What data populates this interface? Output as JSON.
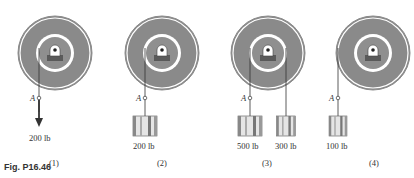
{
  "figure": {
    "caption": "Fig. P16.46",
    "point_label": "A",
    "panels": [
      {
        "id": "(1)",
        "load": "200 lb",
        "load_type": "force-arrow"
      },
      {
        "id": "(2)",
        "load": "200 lb",
        "load_type": "block"
      },
      {
        "id": "(3)",
        "loads": [
          "500 lb",
          "300 lb"
        ],
        "load_type": "two-blocks"
      },
      {
        "id": "(4)",
        "load": "100 lb",
        "load_type": "block"
      }
    ]
  },
  "colors": {
    "disk": "#8a8a8a",
    "ring": "#ffffff",
    "hub": "#8f8f8f",
    "base": "#5a5a5a",
    "line": "#333333"
  }
}
